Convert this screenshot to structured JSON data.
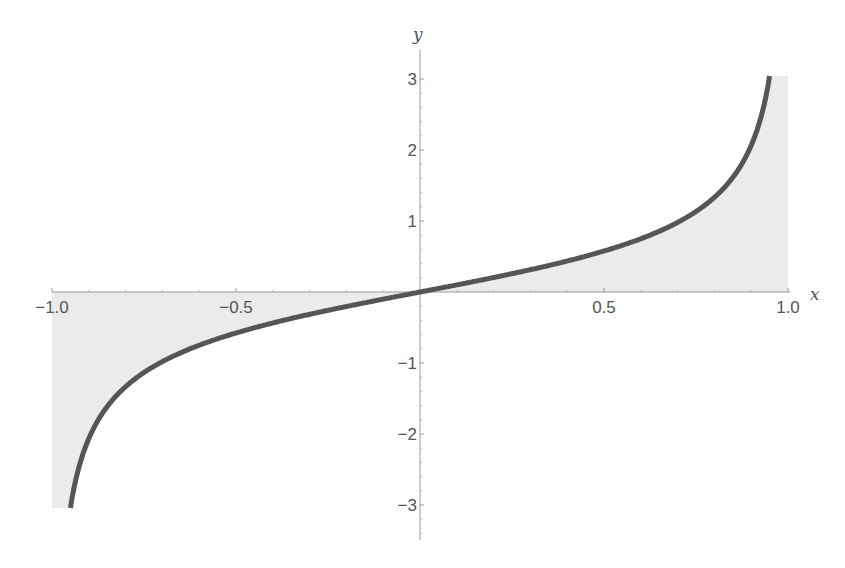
{
  "chart_data": {
    "type": "area",
    "title": "",
    "xlabel": "x",
    "ylabel": "y",
    "function": "x/sqrt(1-x^2)",
    "xlim": [
      -1.0,
      1.0
    ],
    "ylim": [
      -3.5,
      3.3
    ],
    "grid": false,
    "legend": null,
    "x_ticks": [
      {
        "value": -1.0,
        "label": "−1.0"
      },
      {
        "value": -0.5,
        "label": "−0.5"
      },
      {
        "value": 0.5,
        "label": "0.5"
      },
      {
        "value": 1.0,
        "label": "1.0"
      }
    ],
    "y_ticks": [
      {
        "value": 3,
        "label": "3"
      },
      {
        "value": 2,
        "label": "2"
      },
      {
        "value": 1,
        "label": "1"
      },
      {
        "value": -1,
        "label": "−1"
      },
      {
        "value": -2,
        "label": "−2"
      },
      {
        "value": -3,
        "label": "−3"
      }
    ],
    "series": [
      {
        "name": "curve",
        "x": [
          -0.95,
          -0.9,
          -0.8,
          -0.7,
          -0.6,
          -0.5,
          -0.4,
          -0.3,
          -0.2,
          -0.1,
          0.0,
          0.1,
          0.2,
          0.3,
          0.4,
          0.5,
          0.6,
          0.7,
          0.8,
          0.9,
          0.95
        ],
        "y": [
          -3.04,
          -2.06,
          -1.33,
          -0.98,
          -0.75,
          -0.58,
          -0.44,
          -0.31,
          -0.2,
          -0.1,
          0.0,
          0.1,
          0.2,
          0.31,
          0.44,
          0.58,
          0.75,
          0.98,
          1.33,
          2.06,
          3.04
        ]
      }
    ],
    "fill": "between curve and x-axis, extended to x = ±1.0",
    "colors": {
      "curve": "#555555",
      "fill": "#ebebeb",
      "axes": "#9a9a9a",
      "labels": "#555555"
    }
  }
}
